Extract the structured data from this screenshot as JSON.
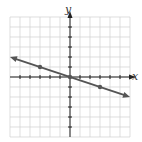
{
  "chart_data": {
    "type": "line",
    "title": "",
    "xlabel": "x",
    "ylabel": "y",
    "xlim": [
      -6,
      6
    ],
    "ylim": [
      -6,
      6
    ],
    "grid": true,
    "tick_spacing": 1,
    "series": [
      {
        "name": "line",
        "equation": "y = -x/3",
        "slope": -0.3333,
        "intercept": 0,
        "arrows": "both",
        "x": [
          -6,
          6
        ],
        "y": [
          2,
          -2
        ],
        "marked_points": [
          [
            -3,
            1
          ],
          [
            0,
            0
          ],
          [
            3,
            -1
          ]
        ],
        "color": "#555555"
      }
    ]
  },
  "labels": {
    "x_axis": "x",
    "y_axis": "y"
  },
  "colors": {
    "grid": "#d0d0d0",
    "axis": "#222222",
    "line": "#555555"
  }
}
